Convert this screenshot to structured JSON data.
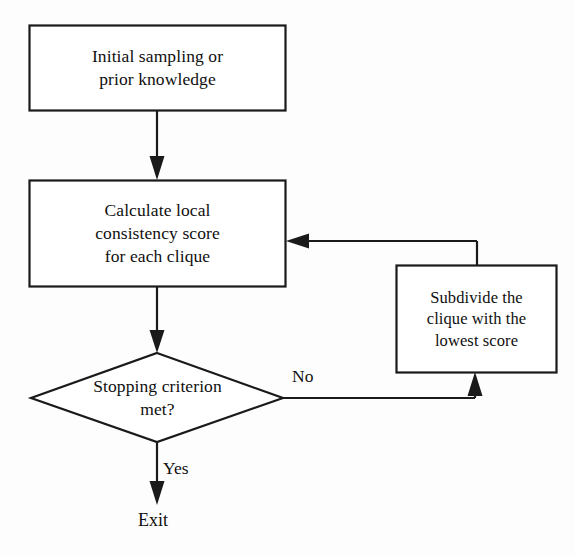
{
  "diagram": {
    "type": "flowchart",
    "background_color": "#fdfdfd",
    "line_color": "#1a1a1a",
    "text_color": "#100f0f",
    "nodes": [
      {
        "id": "initial",
        "shape": "rectangle",
        "lines": [
          "Initial sampling or",
          "prior knowledge"
        ]
      },
      {
        "id": "calculate",
        "shape": "rectangle",
        "lines": [
          "Calculate local",
          "consistency score",
          "for each clique"
        ]
      },
      {
        "id": "subdivide",
        "shape": "rectangle",
        "lines": [
          "Subdivide the",
          "clique with the",
          "lowest score"
        ]
      },
      {
        "id": "stopping",
        "shape": "diamond",
        "lines": [
          "Stopping criterion",
          "met?"
        ]
      }
    ],
    "edge_labels": {
      "no": "No",
      "yes": "Yes"
    },
    "terminal": {
      "exit": "Exit"
    }
  }
}
